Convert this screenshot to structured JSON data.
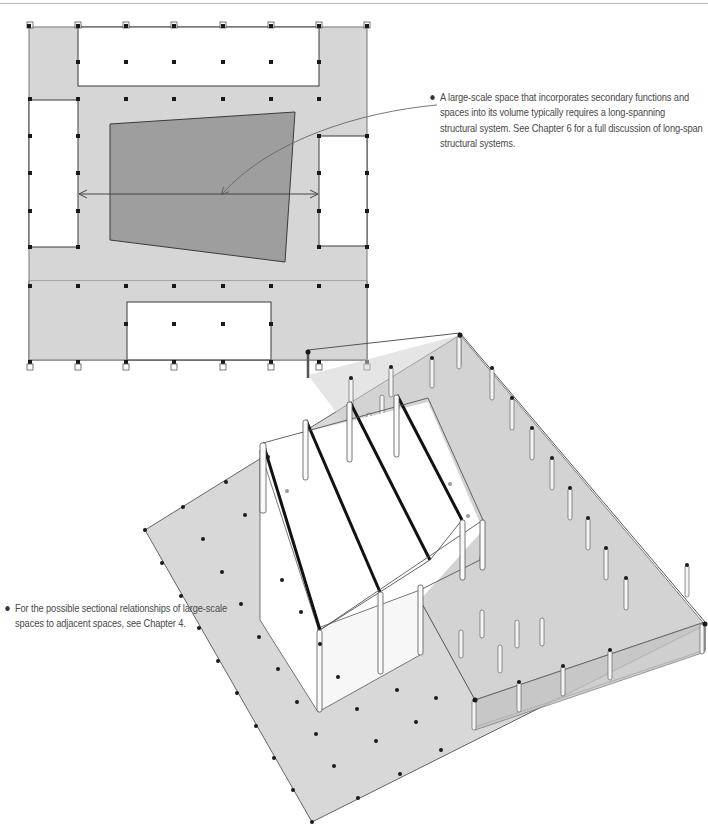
{
  "figure": {
    "type": "architectural-diagram",
    "views": [
      "plan",
      "isometric"
    ],
    "colors": {
      "floor_fill": "#d6d6d6",
      "large_space_fill": "#9e9e9e",
      "line": "#3a3a3a",
      "column": "#1a1a1a",
      "beam": "#111111",
      "background": "#ffffff"
    }
  },
  "annotations": [
    {
      "id": "long-span",
      "text": "A large-scale space that incorporates secondary functions and spaces into its volume typically requires a long-spanning structural system. See Chapter 6 for a full discussion of long-span structural systems."
    },
    {
      "id": "sectional",
      "text": "For the possible sectional relationships of large-scale spaces to adjacent spaces, see Chapter 4."
    }
  ]
}
